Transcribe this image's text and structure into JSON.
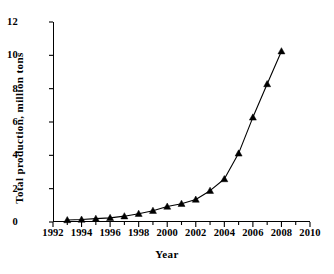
{
  "chart_data": {
    "type": "line",
    "title": "",
    "xlabel": "Year",
    "ylabel": "Total  production,  million tons",
    "xlim": [
      1992,
      2010
    ],
    "ylim": [
      0,
      12
    ],
    "xticks": [
      1992,
      1994,
      1996,
      1998,
      2000,
      2002,
      2004,
      2006,
      2008,
      2010
    ],
    "yticks": [
      0,
      2,
      4,
      6,
      8,
      10,
      12
    ],
    "xtick_labels": [
      "1992",
      "1994",
      "1996",
      "1998",
      "2000",
      "2002",
      "2004",
      "2006",
      "2008",
      "2010"
    ],
    "ytick_labels": [
      "0",
      "2",
      "4",
      "6",
      "8",
      "10",
      "12"
    ],
    "xtick_step_minor": 1,
    "grid": false,
    "legend": null,
    "marker": "triangle-up",
    "marker_color": "#000000",
    "line_color": "#000000",
    "x": [
      1993,
      1994,
      1995,
      1996,
      1997,
      1998,
      1999,
      2000,
      2001,
      2002,
      2003,
      2004,
      2005,
      2006,
      2007,
      2008
    ],
    "series": [
      {
        "name": "Total production",
        "values": [
          0.12,
          0.15,
          0.2,
          0.25,
          0.35,
          0.5,
          0.68,
          0.93,
          1.1,
          1.35,
          1.88,
          2.58,
          4.12,
          6.28,
          8.28,
          10.25
        ]
      }
    ]
  }
}
